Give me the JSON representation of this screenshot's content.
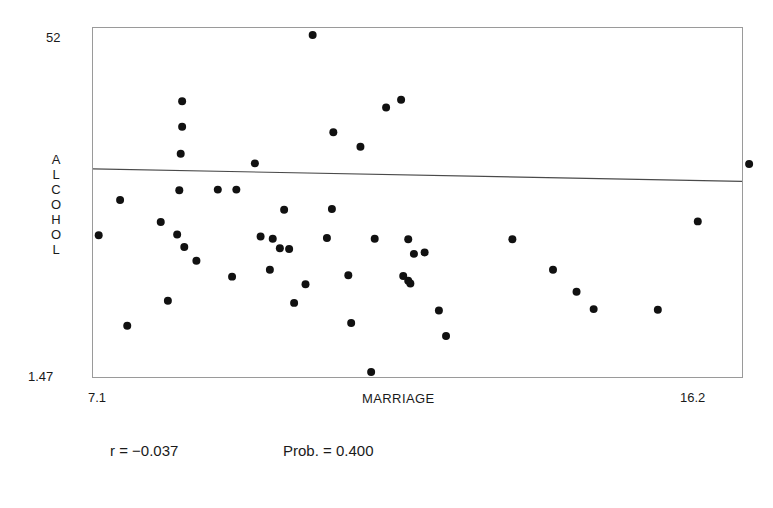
{
  "chart_data": {
    "type": "scatter",
    "title": "",
    "subtitle": "",
    "xlabel": "MARRIAGE",
    "ylabel": "ALCOHOL",
    "xlim": [
      7.1,
      16.2
    ],
    "ylim": [
      1.47,
      52
    ],
    "xticks": [
      "7.1",
      "16.2"
    ],
    "yticks": [
      "1.47",
      "52"
    ],
    "grid": false,
    "legend": null,
    "annotations": [
      {
        "name": "correlation",
        "text": "r = −0.037"
      },
      {
        "name": "probability",
        "text": "Prob. = 0.400"
      }
    ],
    "trendline": {
      "type": "linear-regression",
      "x": [
        7.1,
        16.2
      ],
      "y": [
        31.6,
        29.8
      ]
    },
    "points": [
      {
        "x": 10.18,
        "y": 51.0
      },
      {
        "x": 8.35,
        "y": 41.4
      },
      {
        "x": 8.35,
        "y": 37.7
      },
      {
        "x": 8.33,
        "y": 33.8
      },
      {
        "x": 11.21,
        "y": 40.5
      },
      {
        "x": 11.42,
        "y": 41.6
      },
      {
        "x": 10.47,
        "y": 36.9
      },
      {
        "x": 10.85,
        "y": 34.8
      },
      {
        "x": 9.37,
        "y": 32.4
      },
      {
        "x": 9.11,
        "y": 28.6
      },
      {
        "x": 8.31,
        "y": 28.5
      },
      {
        "x": 8.85,
        "y": 28.6
      },
      {
        "x": 7.48,
        "y": 27.1
      },
      {
        "x": 9.78,
        "y": 25.7
      },
      {
        "x": 10.45,
        "y": 25.8
      },
      {
        "x": 8.05,
        "y": 23.9
      },
      {
        "x": 7.18,
        "y": 22.0
      },
      {
        "x": 8.28,
        "y": 22.1
      },
      {
        "x": 9.45,
        "y": 21.8
      },
      {
        "x": 9.62,
        "y": 21.5
      },
      {
        "x": 10.38,
        "y": 21.6
      },
      {
        "x": 11.05,
        "y": 21.5
      },
      {
        "x": 11.52,
        "y": 21.4
      },
      {
        "x": 8.38,
        "y": 20.3
      },
      {
        "x": 9.72,
        "y": 20.1
      },
      {
        "x": 9.85,
        "y": 20.0
      },
      {
        "x": 11.6,
        "y": 19.3
      },
      {
        "x": 11.75,
        "y": 19.5
      },
      {
        "x": 8.55,
        "y": 18.3
      },
      {
        "x": 9.58,
        "y": 17.0
      },
      {
        "x": 9.05,
        "y": 16.0
      },
      {
        "x": 10.68,
        "y": 16.2
      },
      {
        "x": 11.45,
        "y": 16.1
      },
      {
        "x": 11.52,
        "y": 15.4
      },
      {
        "x": 11.55,
        "y": 15.0
      },
      {
        "x": 10.08,
        "y": 14.9
      },
      {
        "x": 8.15,
        "y": 12.5
      },
      {
        "x": 9.92,
        "y": 12.2
      },
      {
        "x": 11.95,
        "y": 11.1
      },
      {
        "x": 7.58,
        "y": 8.9
      },
      {
        "x": 10.72,
        "y": 9.3
      },
      {
        "x": 12.05,
        "y": 7.4
      },
      {
        "x": 11.0,
        "y": 2.2
      },
      {
        "x": 12.98,
        "y": 21.4
      },
      {
        "x": 13.55,
        "y": 17.0
      },
      {
        "x": 13.88,
        "y": 13.8
      },
      {
        "x": 14.12,
        "y": 11.3
      },
      {
        "x": 15.02,
        "y": 11.2
      },
      {
        "x": 16.3,
        "y": 32.3
      },
      {
        "x": 15.58,
        "y": 24.0
      }
    ]
  },
  "axes": {
    "y_max_label": "52",
    "y_min_label": "1.47",
    "x_min_label": "7.1",
    "x_max_label": "16.2",
    "y_title": "ALCOHOL",
    "x_title": "MARRIAGE"
  },
  "stats": {
    "r_label": "r = −0.037",
    "prob_label": "Prob. = 0.400"
  },
  "colors": {
    "point": "#111111",
    "frame": "#9a9a9a",
    "trendline": "#4a4a4a",
    "text": "#1a1a1a",
    "background": "#ffffff"
  }
}
